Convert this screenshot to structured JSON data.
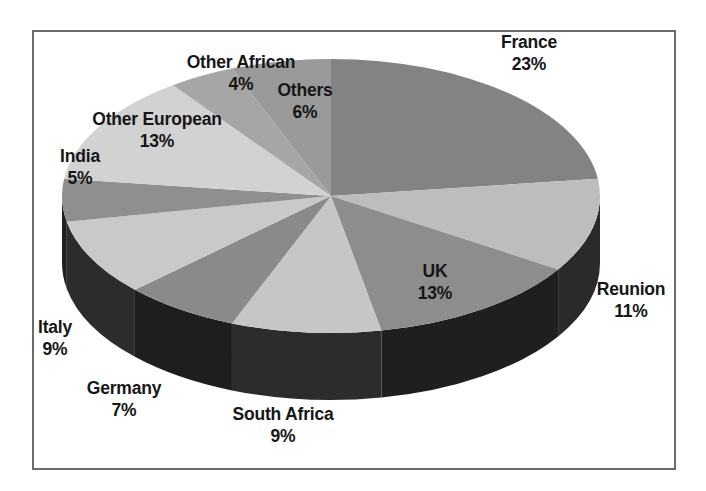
{
  "chart_data": {
    "type": "pie",
    "title": "",
    "subtitle": "",
    "xlabel": "",
    "ylabel": "",
    "legend_position": "none",
    "grid": false,
    "style": "3d-pie",
    "label_format": "name + percent",
    "total_percent": 100,
    "categories": [
      "France",
      "Reunion",
      "UK",
      "South Africa",
      "Germany",
      "Italy",
      "India",
      "Other European",
      "Other African",
      "Others"
    ],
    "values": [
      23,
      11,
      13,
      9,
      7,
      9,
      5,
      13,
      4,
      6
    ],
    "slices": [
      {
        "label": "France",
        "percent": 23,
        "percent_text": "23%",
        "color": "#838383",
        "start_deg": 0,
        "end_deg": 82.8
      },
      {
        "label": "Reunion",
        "percent": 11,
        "percent_text": "11%",
        "color": "#bdbdbd",
        "start_deg": 82.8,
        "end_deg": 122.4
      },
      {
        "label": "UK",
        "percent": 13,
        "percent_text": "13%",
        "color": "#8d8d8d",
        "start_deg": 122.4,
        "end_deg": 169.2
      },
      {
        "label": "South Africa",
        "percent": 9,
        "percent_text": "9%",
        "color": "#c6c6c6",
        "start_deg": 169.2,
        "end_deg": 201.6
      },
      {
        "label": "Germany",
        "percent": 7,
        "percent_text": "7%",
        "color": "#8a8a8a",
        "start_deg": 201.6,
        "end_deg": 226.8
      },
      {
        "label": "Italy",
        "percent": 9,
        "percent_text": "9%",
        "color": "#c9c9c9",
        "start_deg": 226.8,
        "end_deg": 259.2
      },
      {
        "label": "India",
        "percent": 5,
        "percent_text": "5%",
        "color": "#8f8f8f",
        "start_deg": 259.2,
        "end_deg": 277.2
      },
      {
        "label": "Other European",
        "percent": 13,
        "percent_text": "13%",
        "color": "#d2d2d2",
        "start_deg": 277.2,
        "end_deg": 324.0
      },
      {
        "label": "Other African",
        "percent": 4,
        "percent_text": "4%",
        "color": "#a6a6a6",
        "start_deg": 324.0,
        "end_deg": 338.4
      },
      {
        "label": "Others",
        "percent": 6,
        "percent_text": "6%",
        "color": "#9a9a9a",
        "start_deg": 338.4,
        "end_deg": 360.0
      }
    ],
    "side_colors": {
      "dark": "#1c1c1c",
      "darker": "#0e0e0e"
    }
  },
  "labels": {
    "france": {
      "name": "France",
      "percent": "23%"
    },
    "reunion": {
      "name": "Reunion",
      "percent": "11%"
    },
    "uk": {
      "name": "UK",
      "percent": "13%"
    },
    "south_africa": {
      "name": "South Africa",
      "percent": "9%"
    },
    "germany": {
      "name": "Germany",
      "percent": "7%"
    },
    "italy": {
      "name": "Italy",
      "percent": "9%"
    },
    "india": {
      "name": "India",
      "percent": "5%"
    },
    "other_european": {
      "name": "Other European",
      "percent": "13%"
    },
    "other_african": {
      "name": "Other African",
      "percent": "4%"
    },
    "others": {
      "name": "Others",
      "percent": "6%"
    }
  },
  "frame": {
    "border_color": "#6b6b6b",
    "background": "#ffffff"
  }
}
